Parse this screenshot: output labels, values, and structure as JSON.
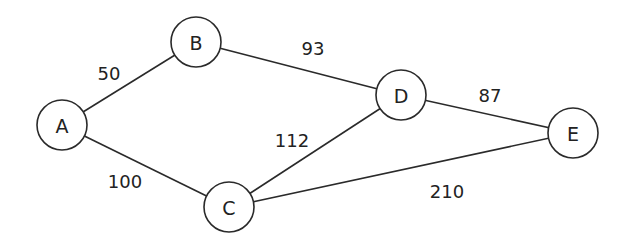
{
  "graph": {
    "nodes": [
      {
        "id": "A",
        "label": "A",
        "x": 62,
        "y": 125,
        "r": 25
      },
      {
        "id": "B",
        "label": "B",
        "x": 196,
        "y": 42,
        "r": 25
      },
      {
        "id": "C",
        "label": "C",
        "x": 229,
        "y": 207,
        "r": 25
      },
      {
        "id": "D",
        "label": "D",
        "x": 401,
        "y": 95,
        "r": 25
      },
      {
        "id": "E",
        "label": "E",
        "x": 573,
        "y": 133,
        "r": 25
      }
    ],
    "edges": [
      {
        "from": "A",
        "to": "B",
        "weight": "50",
        "lx": 109,
        "ly": 73
      },
      {
        "from": "A",
        "to": "C",
        "weight": "100",
        "lx": 125,
        "ly": 181
      },
      {
        "from": "B",
        "to": "D",
        "weight": "93",
        "lx": 313,
        "ly": 48
      },
      {
        "from": "C",
        "to": "D",
        "weight": "112",
        "lx": 292,
        "ly": 140
      },
      {
        "from": "D",
        "to": "E",
        "weight": "87",
        "lx": 490,
        "ly": 95
      },
      {
        "from": "C",
        "to": "E",
        "weight": "210",
        "lx": 447,
        "ly": 191
      }
    ]
  },
  "colors": {
    "stroke": "#2a2a2a",
    "text": "#222222",
    "background": "#ffffff"
  }
}
